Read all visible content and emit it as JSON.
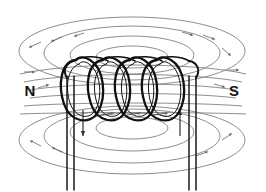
{
  "diagram": {
    "type": "physics-field-diagram",
    "background_color": "#ffffff",
    "stroke_color_coil": "#101010",
    "stroke_color_field": "#777777",
    "stroke_color_lead": "#1a1a1a",
    "label_color": "#151515"
  },
  "labels": {
    "north_pole": "N",
    "south_pole": "S"
  },
  "coil": {
    "turns": 4,
    "turn_centers_x": [
      92,
      119,
      146,
      173
    ],
    "loop_rx": 16,
    "loop_ry": 34,
    "center_y": 90,
    "wire_width": 2.2,
    "inner_wire_width": 1.0
  },
  "leads": {
    "left_x": [
      67,
      74
    ],
    "right_x": [
      189,
      196
    ],
    "top_y": 72,
    "bottom_y": 190,
    "current_arrow_left": "down",
    "current_arrow_right": "up",
    "arrow_left_x": 70,
    "arrow_right_x": 192,
    "arrow_top_y": 112,
    "arrow_bottom_y": 136
  },
  "field_lines": {
    "center_x": 132,
    "upper_center_y": 57,
    "lower_center_y": 130,
    "upper_ellipses": [
      {
        "rx": 36,
        "ry": 11
      },
      {
        "rx": 62,
        "ry": 19
      },
      {
        "rx": 88,
        "ry": 27
      },
      {
        "rx": 113,
        "ry": 34
      }
    ],
    "lower_ellipses": [
      {
        "rx": 36,
        "ry": 11
      },
      {
        "rx": 62,
        "ry": 19
      },
      {
        "rx": 88,
        "ry": 27
      },
      {
        "rx": 113,
        "ry": 34
      }
    ],
    "interior_lines_y": [
      74,
      81,
      88,
      95,
      102,
      109
    ],
    "arrow_count": 14
  }
}
